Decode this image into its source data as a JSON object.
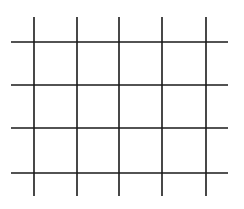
{
  "diagram": {
    "type": "grid",
    "line_color": "#1a1a1a",
    "background": "#ffffff",
    "line_width": 1.6,
    "vertical_lines": [
      {
        "x": 34,
        "y1": 17,
        "y2": 196
      },
      {
        "x": 77,
        "y1": 17,
        "y2": 196
      },
      {
        "x": 119,
        "y1": 17,
        "y2": 196
      },
      {
        "x": 162,
        "y1": 17,
        "y2": 196
      },
      {
        "x": 206,
        "y1": 17,
        "y2": 196
      }
    ],
    "horizontal_lines": [
      {
        "y": 42,
        "x1": 11,
        "x2": 228
      },
      {
        "y": 85,
        "x1": 11,
        "x2": 228
      },
      {
        "y": 128,
        "x1": 11,
        "x2": 228
      },
      {
        "y": 173,
        "x1": 11,
        "x2": 228
      }
    ]
  }
}
